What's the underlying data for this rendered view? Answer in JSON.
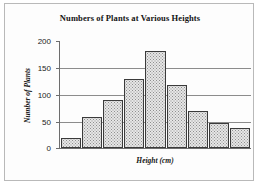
{
  "chart_data": {
    "type": "bar",
    "title": "Numbers of Plants at Various Heights",
    "xlabel": "Height (cm)",
    "ylabel": "Number of Plants",
    "categories": [
      "1",
      "2",
      "3",
      "4",
      "5",
      "6",
      "7",
      "8",
      "9"
    ],
    "values": [
      19,
      58,
      89,
      128,
      180,
      117,
      68,
      47,
      37
    ],
    "ylim": [
      0,
      200
    ],
    "yticks": [
      0,
      50,
      100,
      150,
      200
    ],
    "ytick_labels": [
      "0",
      "50",
      "100",
      "150",
      "200"
    ],
    "xtick_labels": [],
    "grid": true,
    "legend": false,
    "bar_fill_color": "#e6e6e6",
    "bar_edge_color": "#3b3b3b",
    "axis_color": "#6d6d6d",
    "gridline_color": "#8c8c8c",
    "background_color": "#ffffff",
    "border_color": "#b9b9b9"
  }
}
